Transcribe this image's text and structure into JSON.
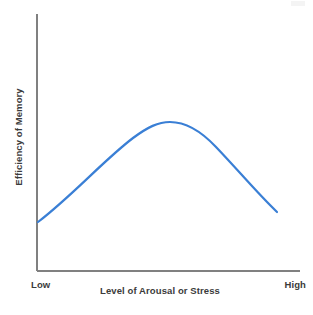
{
  "chart_data": {
    "type": "line",
    "title": "",
    "subtitle": "",
    "xlabel": "Level of Arousal or Stress",
    "ylabel": "Efficiency of Memory",
    "xtick_labels": [
      "Low",
      "High"
    ],
    "ytick_labels": [],
    "xlim": [
      0,
      1
    ],
    "ylim": [
      0,
      1
    ],
    "grid": false,
    "legend": false,
    "legend_position": "none",
    "annotations": [],
    "series": [
      {
        "name": "Efficiency of Memory",
        "color": "#3a7fd5",
        "line_width": 2.2,
        "x": [
          0.0,
          0.1,
          0.2,
          0.3,
          0.4,
          0.5,
          0.55,
          0.6,
          0.7,
          0.8,
          0.9,
          1.0
        ],
        "y": [
          0.19,
          0.36,
          0.52,
          0.65,
          0.76,
          0.84,
          0.86,
          0.85,
          0.79,
          0.67,
          0.5,
          0.28
        ],
        "peak_x": 0.55,
        "peak_y": 0.86
      }
    ]
  },
  "axes": {
    "line_color": "#808080",
    "y_axis": {
      "x": 37,
      "y_top": 14,
      "y_bottom": 271
    },
    "x_axis": {
      "y": 271,
      "x_left": 37,
      "x_right": 300
    }
  },
  "style": {
    "background": "#ffffff",
    "text_color": "#3b3b3b",
    "curve_color": "#3a7fd5"
  },
  "curve_geometry": {
    "start": [
      38,
      222
    ],
    "peak": [
      168,
      122
    ],
    "end": [
      277,
      212
    ],
    "path": "M 38 222 C 72 196, 104 160, 133 138 C 148 127, 158 122, 170 122 C 186 122, 200 130, 216 147 C 238 170, 258 194, 277 212"
  }
}
